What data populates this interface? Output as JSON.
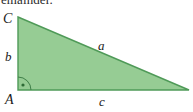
{
  "figure": {
    "type": "right-triangle-diagram",
    "caption_clipped": "emainder.",
    "colors": {
      "fill": "#96cc94",
      "stroke": "#4f9a58",
      "background": "#ffffff",
      "text": "#1a1a1a"
    },
    "vertices": [
      {
        "name": "C",
        "label": "C",
        "x": 18,
        "y": 17,
        "label_x": 3,
        "label_y": 12
      },
      {
        "name": "A",
        "label": "A",
        "x": 18,
        "y": 90,
        "label_x": 5,
        "label_y": 93
      },
      {
        "name": "B",
        "label": "",
        "x": 189,
        "y": 90,
        "label_x": 0,
        "label_y": 0
      }
    ],
    "sides": [
      {
        "name": "hypotenuse",
        "label": "a",
        "from": "C",
        "to": "B",
        "label_x": 98,
        "label_y": 39
      },
      {
        "name": "vertical-leg",
        "label": "b",
        "from": "A",
        "to": "C",
        "label_x": 5,
        "label_y": 50
      },
      {
        "name": "horizontal-leg",
        "label": "c",
        "from": "A",
        "to": "B",
        "label_x": 99,
        "label_y": 95
      }
    ],
    "right_angle": {
      "at_vertex": "A",
      "marker": "arc-with-dot",
      "radius": 13,
      "dot_x": 23,
      "dot_y": 85
    }
  }
}
